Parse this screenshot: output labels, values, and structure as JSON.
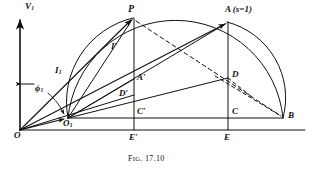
{
  "figure": {
    "caption_prefix": "F",
    "caption_small": "IG",
    "caption_rest": ". 17.10",
    "caption_full": "FIG. 17.10",
    "background_color": "#ffffff",
    "line_color": "#111111"
  },
  "axis": {
    "vertical_label": "V",
    "vertical_label_sub": "1",
    "origin_label": "O"
  },
  "points": [
    {
      "id": "O",
      "label": "O",
      "sub": "",
      "x": 20,
      "y": 130
    },
    {
      "id": "O1",
      "label": "O",
      "sub": "1",
      "x": 68,
      "y": 118
    },
    {
      "id": "P",
      "label": "P",
      "sub": "",
      "x": 133,
      "y": 18
    },
    {
      "id": "A",
      "label": "A",
      "sub": "",
      "x": 227,
      "y": 22
    },
    {
      "id": "B",
      "label": "B",
      "sub": "",
      "x": 283,
      "y": 118
    },
    {
      "id": "C",
      "label": "C",
      "sub": "",
      "x": 228,
      "y": 118
    },
    {
      "id": "Cp",
      "label": "C",
      "sub": "",
      "prime": true,
      "x": 134,
      "y": 118
    },
    {
      "id": "D",
      "label": "D",
      "sub": "",
      "x": 228,
      "y": 78
    },
    {
      "id": "Dp",
      "label": "D",
      "sub": "",
      "prime": true,
      "x": 134,
      "y": 95
    },
    {
      "id": "Ap",
      "label": "A",
      "sub": "",
      "prime": true,
      "x": 134,
      "y": 79
    },
    {
      "id": "E",
      "label": "E",
      "sub": "",
      "x": 228,
      "y": 140
    },
    {
      "id": "Ep",
      "label": "E",
      "sub": "",
      "prime": true,
      "x": 134,
      "y": 140
    }
  ],
  "labels": {
    "v1": {
      "text": "V",
      "sub": "1",
      "prime": false
    },
    "a_s_equal": {
      "text": "A (s=1)"
    },
    "p": {
      "text": "P"
    },
    "i_prime": {
      "text": "I",
      "prime": true
    },
    "i1": {
      "text": "I",
      "sub": "1"
    },
    "phi1": {
      "text": "ϕ",
      "sub": "1"
    },
    "a_prime": {
      "text": "A",
      "prime": true
    },
    "d_prime": {
      "text": "D",
      "prime": true
    },
    "c_prime": {
      "text": "C",
      "prime": true
    },
    "e_prime": {
      "text": "E",
      "prime": true
    },
    "o": {
      "text": "O"
    },
    "o1": {
      "text": "O",
      "sub": "1"
    },
    "b": {
      "text": "B"
    },
    "c": {
      "text": "C"
    },
    "d": {
      "text": "D"
    },
    "e": {
      "text": "E"
    }
  },
  "annotations": {
    "slip_note": "s=1",
    "figure_number": "17.10"
  }
}
